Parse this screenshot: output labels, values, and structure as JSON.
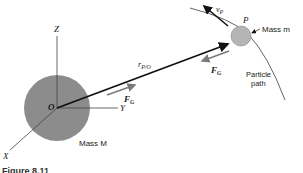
{
  "diagram": {
    "labels": {
      "z_axis": "Z",
      "y_axis": "Y",
      "x_axis": "X",
      "origin": "O",
      "mass_big": "Mass M",
      "mass_small": "Mass m",
      "particle": "P",
      "position_vector_main": "r",
      "position_vector_sub": "P/O",
      "velocity_main": "v",
      "velocity_sub": "P",
      "force_main": "F",
      "force_sub": "G",
      "path_line1": "Particle",
      "path_line2": "path"
    },
    "caption": "Figure 8.11",
    "colors": {
      "big_sphere": "#8c8c8c",
      "small_sphere": "#b5b5b5",
      "force_arrow": "#7a7a7a",
      "vector": "#111111",
      "axes": "#444444",
      "path": "#555555"
    }
  }
}
